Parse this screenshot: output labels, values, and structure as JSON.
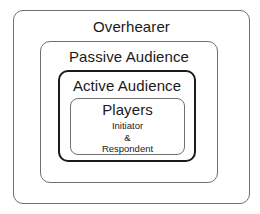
{
  "diagram": {
    "overhearer": {
      "label": "Overhearer"
    },
    "passive_audience": {
      "label": "Passive Audience"
    },
    "active_audience": {
      "label": "Active Audience"
    },
    "players": {
      "label": "Players",
      "initiator": "Initiator",
      "ampersand": "&",
      "respondent": "Respondent"
    }
  },
  "colors": {
    "background": "#ffffff",
    "thin_border": "#6f6f6f",
    "thick_border": "#1a1a1a",
    "text": "#1a1a1a"
  }
}
